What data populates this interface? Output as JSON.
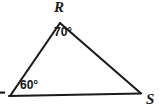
{
  "figure": {
    "type": "geometry-diagram",
    "shape": "triangle",
    "background_color": "#ffffff",
    "stroke_color": "#1a1a1a",
    "stroke_width": 2,
    "vertices": [
      {
        "name": "R",
        "label": "R",
        "x": 60,
        "y": 23,
        "label_x": 54,
        "label_y": 0
      },
      {
        "name": "S",
        "label": "S",
        "x": 140,
        "y": 93,
        "label_x": 146,
        "label_y": 92
      },
      {
        "name": "left",
        "label": "",
        "x": 10,
        "y": 96,
        "label_x": 0,
        "label_y": 90
      }
    ],
    "angles": [
      {
        "at": "R",
        "label": "70°",
        "value": 70,
        "x": 54,
        "y": 26
      },
      {
        "at": "left",
        "label": "60°",
        "value": 60,
        "x": 20,
        "y": 79
      }
    ],
    "edge_mark": {
      "name": "cut-off-vertex-label-mark",
      "x": 0,
      "y": 92,
      "width": 5,
      "height": 2
    }
  }
}
